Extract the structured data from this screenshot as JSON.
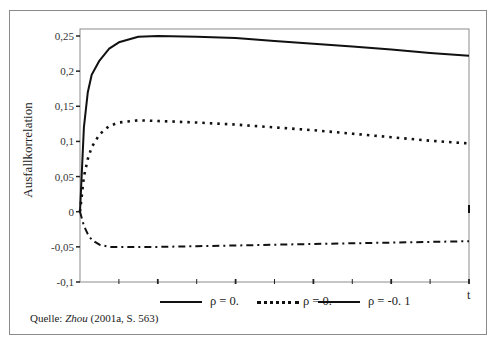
{
  "chart_data": {
    "type": "line",
    "title": "",
    "xlabel": "t",
    "ylabel": "Ausfallkorrelation",
    "ylim": [
      -0.1,
      0.25
    ],
    "yticks": [
      "0,25",
      "0,2",
      "0,15",
      "0,1",
      "0,05",
      "0",
      "-0,05",
      "-0,1"
    ],
    "ytick_values": [
      0.25,
      0.2,
      0.15,
      0.1,
      0.05,
      0,
      -0.05,
      -0.1
    ],
    "x_tick_count": 10,
    "grid": false,
    "legend_position": "bottom",
    "x": [
      0,
      0.1,
      0.2,
      0.3,
      0.5,
      0.75,
      1,
      1.5,
      2,
      3,
      4,
      5,
      6,
      7,
      8,
      9,
      10
    ],
    "series": [
      {
        "name": "ρ = 0.",
        "style": "solid",
        "values": [
          0,
          0.12,
          0.17,
          0.195,
          0.215,
          0.232,
          0.241,
          0.249,
          0.25,
          0.249,
          0.247,
          0.243,
          0.239,
          0.235,
          0.231,
          0.226,
          0.222
        ]
      },
      {
        "name": "ρ = 0.",
        "style": "dotted",
        "values": [
          0,
          0.05,
          0.075,
          0.092,
          0.11,
          0.122,
          0.127,
          0.13,
          0.129,
          0.127,
          0.124,
          0.12,
          0.116,
          0.111,
          0.106,
          0.101,
          0.097
        ]
      },
      {
        "name": "ρ = -0. 1",
        "style": "dash-dot",
        "values": [
          0,
          -0.02,
          -0.032,
          -0.04,
          -0.047,
          -0.05,
          -0.05,
          -0.05,
          -0.05,
          -0.049,
          -0.048,
          -0.047,
          -0.046,
          -0.045,
          -0.044,
          -0.043,
          -0.042
        ]
      }
    ]
  },
  "legend": [
    {
      "label": "ρ = 0.",
      "style": "solid"
    },
    {
      "label": "ρ = 0.",
      "style": "dotted"
    },
    {
      "label": "ρ = -0. 1",
      "style": "solid"
    }
  ],
  "axis": {
    "y_title": "Ausfallkorrelation",
    "x_title": "t"
  },
  "source": {
    "prefix": "Quelle: ",
    "author": "Zhou",
    "rest": " (2001a, S. 563)"
  }
}
